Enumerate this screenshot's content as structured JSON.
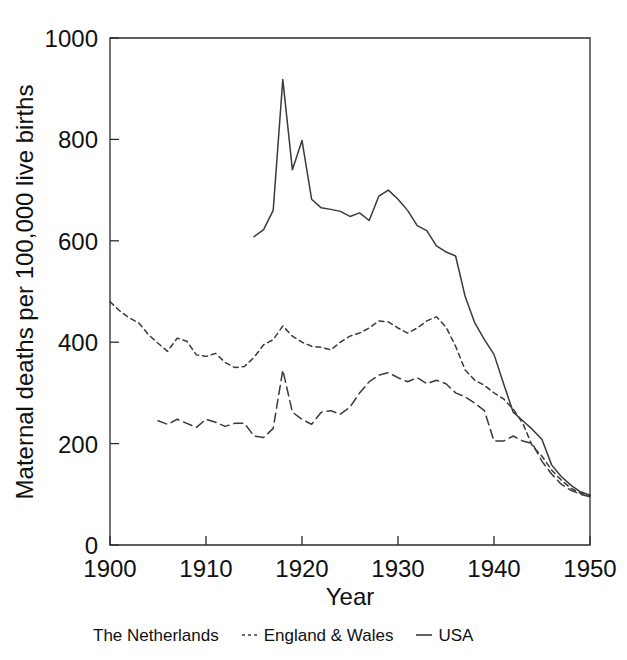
{
  "chart_data": {
    "type": "line",
    "title": "",
    "xlabel": "Year",
    "ylabel": "Maternal deaths per 100,000 live births",
    "xlim": [
      1900,
      1950
    ],
    "ylim": [
      0,
      1000
    ],
    "xticks": [
      1900,
      1910,
      1920,
      1930,
      1940,
      1950
    ],
    "yticks": [
      0,
      200,
      400,
      600,
      800,
      1000
    ],
    "grid": false,
    "legend_position": "below-plot",
    "series": [
      {
        "name": "The Netherlands",
        "line_style": "long-dash",
        "x": [
          1905,
          1906,
          1907,
          1908,
          1909,
          1910,
          1911,
          1912,
          1913,
          1914,
          1915,
          1916,
          1917,
          1918,
          1919,
          1920,
          1921,
          1922,
          1923,
          1924,
          1925,
          1926,
          1927,
          1928,
          1929,
          1930,
          1931,
          1932,
          1933,
          1934,
          1935,
          1936,
          1937,
          1938,
          1939,
          1940,
          1941,
          1942,
          1943,
          1944,
          1945,
          1946,
          1947,
          1948,
          1949,
          1950
        ],
        "values": [
          245,
          238,
          248,
          240,
          232,
          248,
          242,
          234,
          240,
          240,
          215,
          212,
          230,
          345,
          262,
          248,
          238,
          262,
          265,
          258,
          272,
          300,
          322,
          335,
          340,
          330,
          322,
          330,
          318,
          325,
          318,
          300,
          292,
          280,
          265,
          205,
          205,
          215,
          205,
          200,
          165,
          140,
          120,
          108,
          100,
          95
        ]
      },
      {
        "name": "England & Wales",
        "line_style": "short-dash",
        "x": [
          1900,
          1901,
          1902,
          1903,
          1904,
          1905,
          1906,
          1907,
          1908,
          1909,
          1910,
          1911,
          1912,
          1913,
          1914,
          1915,
          1916,
          1917,
          1918,
          1919,
          1920,
          1921,
          1922,
          1923,
          1924,
          1925,
          1926,
          1927,
          1928,
          1929,
          1930,
          1931,
          1932,
          1933,
          1934,
          1935,
          1936,
          1937,
          1938,
          1939,
          1940,
          1941,
          1942,
          1943,
          1944,
          1945,
          1946,
          1947,
          1948,
          1949,
          1950
        ],
        "values": [
          480,
          462,
          448,
          438,
          415,
          398,
          382,
          408,
          402,
          375,
          372,
          378,
          360,
          350,
          352,
          370,
          395,
          405,
          432,
          412,
          400,
          392,
          390,
          385,
          400,
          412,
          418,
          428,
          442,
          440,
          428,
          418,
          428,
          442,
          450,
          430,
          392,
          345,
          325,
          315,
          300,
          288,
          268,
          240,
          195,
          175,
          148,
          128,
          112,
          102,
          98
        ]
      },
      {
        "name": "USA",
        "line_style": "solid",
        "x": [
          1915,
          1916,
          1917,
          1918,
          1919,
          1920,
          1921,
          1922,
          1923,
          1924,
          1925,
          1926,
          1927,
          1928,
          1929,
          1930,
          1931,
          1932,
          1933,
          1934,
          1935,
          1936,
          1937,
          1938,
          1939,
          1940,
          1941,
          1942,
          1943,
          1944,
          1945,
          1946,
          1947,
          1948,
          1949,
          1950
        ],
        "values": [
          608,
          622,
          660,
          918,
          740,
          798,
          682,
          665,
          662,
          658,
          648,
          655,
          640,
          688,
          700,
          682,
          660,
          630,
          620,
          590,
          578,
          570,
          490,
          438,
          405,
          376,
          318,
          262,
          245,
          228,
          208,
          158,
          135,
          118,
          105,
          98
        ]
      }
    ]
  },
  "legend": {
    "entries": [
      {
        "label": "The Netherlands",
        "swatch": "long-dash-swatch"
      },
      {
        "label": "England & Wales",
        "swatch": "short-dash-swatch"
      },
      {
        "label": "USA",
        "swatch": "solid-dash-swatch"
      }
    ]
  },
  "colors": {
    "line": "#3a3a3a",
    "axis": "#2b2b2b",
    "text": "#111111",
    "background": "#ffffff"
  }
}
